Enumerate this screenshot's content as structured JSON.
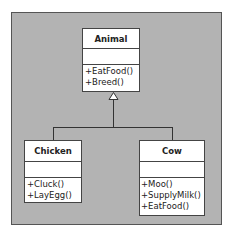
{
  "diagram": {
    "type": "uml-class-diagram",
    "classes": [
      {
        "name": "Animal",
        "attributes": [],
        "operations": [
          "+EatFood()",
          "+Breed()"
        ]
      },
      {
        "name": "Chicken",
        "attributes": [],
        "operations": [
          "+Cluck()",
          "+LayEgg()"
        ]
      },
      {
        "name": "Cow",
        "attributes": [],
        "operations": [
          "+Moo()",
          "+SupplyMilk()",
          "+EatFood()"
        ]
      }
    ],
    "relationships": [
      {
        "type": "generalization",
        "from": "Chicken",
        "to": "Animal"
      },
      {
        "type": "generalization",
        "from": "Cow",
        "to": "Animal"
      }
    ]
  },
  "colors": {
    "frame_background": "#b3b3b3",
    "class_background": "#ffffff",
    "line": "#333333"
  }
}
